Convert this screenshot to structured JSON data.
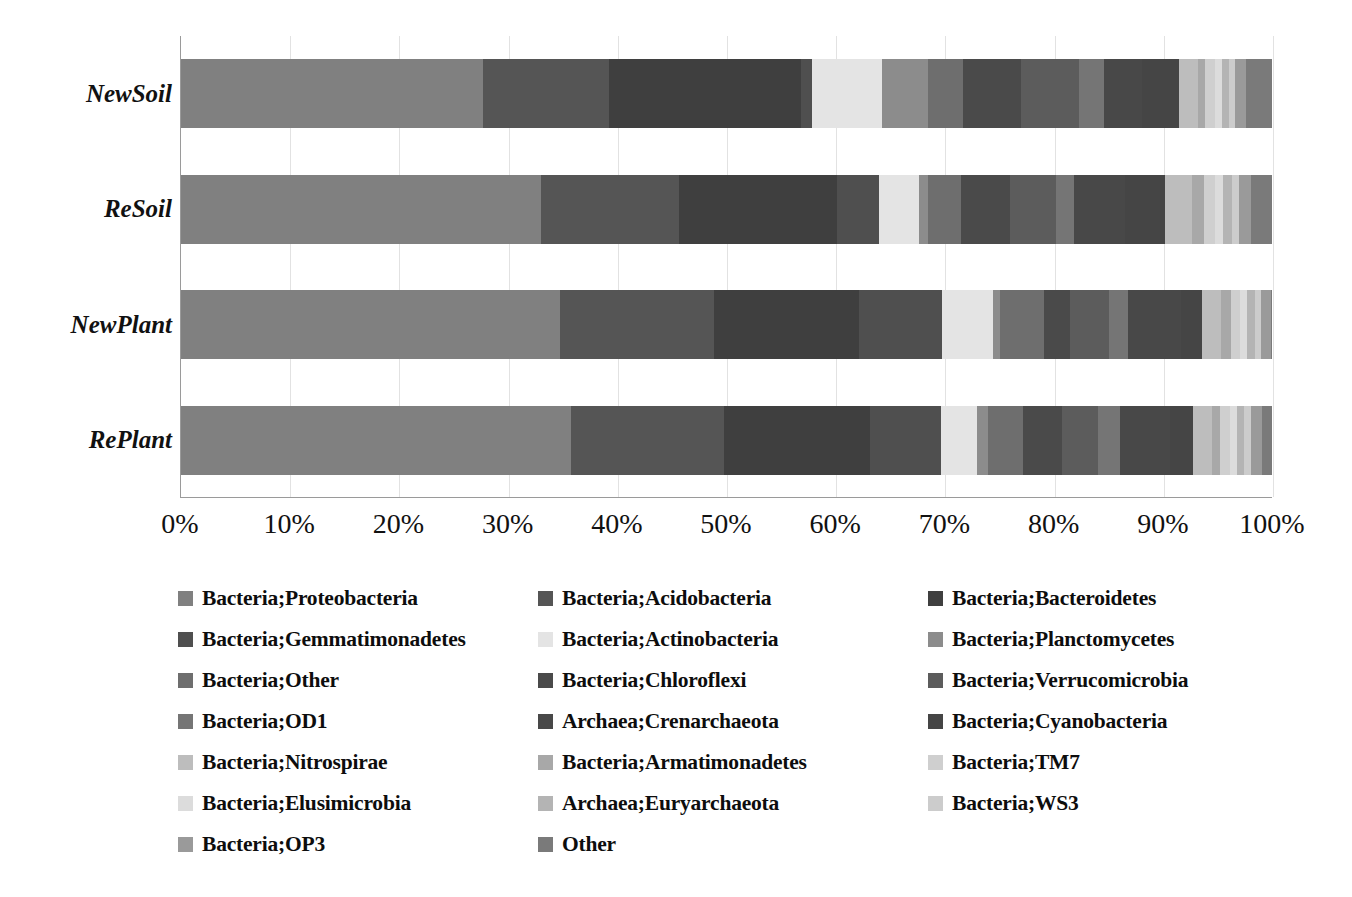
{
  "chart_data": {
    "type": "bar",
    "subtype": "horizontal-stacked-100",
    "title": "",
    "xlabel": "",
    "ylabel": "",
    "xlim": [
      0,
      100
    ],
    "xtick_labels": [
      "0%",
      "10%",
      "20%",
      "30%",
      "40%",
      "50%",
      "60%",
      "70%",
      "80%",
      "90%",
      "100%"
    ],
    "xtick_values": [
      0,
      10,
      20,
      30,
      40,
      50,
      60,
      70,
      80,
      90,
      100
    ],
    "grid": true,
    "legend_position": "bottom",
    "categories": [
      "NewSoil",
      "ReSoil",
      "NewPlant",
      "RePlant"
    ],
    "series": [
      {
        "name": "Bacteria;Proteobacteria",
        "color": "#808080",
        "values": [
          27.7,
          33.0,
          34.5,
          35.7
        ]
      },
      {
        "name": "Bacteria;Acidobacteria",
        "color": "#555555",
        "values": [
          11.5,
          12.6,
          14.1,
          14.0
        ]
      },
      {
        "name": "Bacteria;Bacteroidetes",
        "color": "#3f3f3f",
        "values": [
          17.6,
          14.5,
          13.2,
          13.4
        ]
      },
      {
        "name": "Bacteria;Gemmatimonadetes",
        "color": "#4f4f4f",
        "values": [
          1.0,
          3.8,
          7.5,
          6.5
        ]
      },
      {
        "name": "Bacteria;Actinobacteria",
        "color": "#e4e4e4",
        "values": [
          6.4,
          3.7,
          4.7,
          3.3
        ]
      },
      {
        "name": "Bacteria;Planctomycetes",
        "color": "#8c8c8c",
        "values": [
          4.2,
          0.8,
          0.6,
          1.0
        ]
      },
      {
        "name": "Bacteria;Other",
        "color": "#6e6e6e",
        "values": [
          3.2,
          3.0,
          4.0,
          3.2
        ]
      },
      {
        "name": "Bacteria;Chloroflexi",
        "color": "#4a4a4a",
        "values": [
          5.3,
          4.5,
          2.4,
          3.6
        ]
      },
      {
        "name": "Bacteria;Verrucomicrobia",
        "color": "#5c5c5c",
        "values": [
          5.3,
          4.2,
          3.6,
          3.3
        ]
      },
      {
        "name": "Bacteria;OD1",
        "color": "#757575",
        "values": [
          2.3,
          1.7,
          1.7,
          2.0
        ]
      },
      {
        "name": "Archaea;Crenarchaeota",
        "color": "#484848",
        "values": [
          3.5,
          4.7,
          4.8,
          4.6
        ]
      },
      {
        "name": "Bacteria;Cyanobacteria",
        "color": "#454545",
        "values": [
          3.4,
          3.6,
          1.9,
          2.1
        ]
      },
      {
        "name": "Bacteria;Nitrospirae",
        "color": "#bdbdbd",
        "values": [
          1.7,
          2.5,
          1.8,
          1.7
        ]
      },
      {
        "name": "Bacteria;Armatimonadetes",
        "color": "#a8a8a8",
        "values": [
          0.7,
          1.1,
          0.9,
          0.8
        ]
      },
      {
        "name": "Bacteria;TM7",
        "color": "#cfcfcf",
        "values": [
          0.9,
          1.0,
          0.8,
          0.9
        ]
      },
      {
        "name": "Bacteria;Elusimicrobia",
        "color": "#dcdcdc",
        "values": [
          0.6,
          0.7,
          0.6,
          0.6
        ]
      },
      {
        "name": "Archaea;Euryarchaeota",
        "color": "#b4b4b4",
        "values": [
          0.7,
          0.9,
          0.8,
          0.7
        ]
      },
      {
        "name": "Bacteria;WS3",
        "color": "#cccccc",
        "values": [
          0.5,
          0.6,
          0.5,
          0.6
        ]
      },
      {
        "name": "Bacteria;OP3",
        "color": "#9a9a9a",
        "values": [
          1.0,
          1.1,
          0.9,
          1.0
        ]
      },
      {
        "name": "Other",
        "color": "#7a7a7a",
        "values": [
          2.5,
          2.0,
          0.2,
          1.0
        ]
      }
    ]
  },
  "axis": {
    "category_labels": [
      "NewSoil",
      "ReSoil",
      "NewPlant",
      "RePlant"
    ],
    "ticks": [
      "0%",
      "10%",
      "20%",
      "30%",
      "40%",
      "50%",
      "60%",
      "70%",
      "80%",
      "90%",
      "100%"
    ]
  },
  "legend": {
    "items": [
      {
        "label": "Bacteria;Proteobacteria",
        "color": "#808080"
      },
      {
        "label": "Bacteria;Acidobacteria",
        "color": "#555555"
      },
      {
        "label": "Bacteria;Bacteroidetes",
        "color": "#3f3f3f"
      },
      {
        "label": "Bacteria;Gemmatimonadetes",
        "color": "#4f4f4f"
      },
      {
        "label": "Bacteria;Actinobacteria",
        "color": "#e4e4e4"
      },
      {
        "label": "Bacteria;Planctomycetes",
        "color": "#8c8c8c"
      },
      {
        "label": "Bacteria;Other",
        "color": "#6e6e6e"
      },
      {
        "label": "Bacteria;Chloroflexi",
        "color": "#4a4a4a"
      },
      {
        "label": "Bacteria;Verrucomicrobia",
        "color": "#5c5c5c"
      },
      {
        "label": "Bacteria;OD1",
        "color": "#757575"
      },
      {
        "label": "Archaea;Crenarchaeota",
        "color": "#484848"
      },
      {
        "label": "Bacteria;Cyanobacteria",
        "color": "#454545"
      },
      {
        "label": "Bacteria;Nitrospirae",
        "color": "#bdbdbd"
      },
      {
        "label": "Bacteria;Armatimonadetes",
        "color": "#a8a8a8"
      },
      {
        "label": "Bacteria;TM7",
        "color": "#cfcfcf"
      },
      {
        "label": "Bacteria;Elusimicrobia",
        "color": "#dcdcdc"
      },
      {
        "label": "Archaea;Euryarchaeota",
        "color": "#b4b4b4"
      },
      {
        "label": "Bacteria;WS3",
        "color": "#cccccc"
      },
      {
        "label": "Bacteria;OP3",
        "color": "#9a9a9a"
      },
      {
        "label": "Other",
        "color": "#7a7a7a"
      }
    ]
  }
}
